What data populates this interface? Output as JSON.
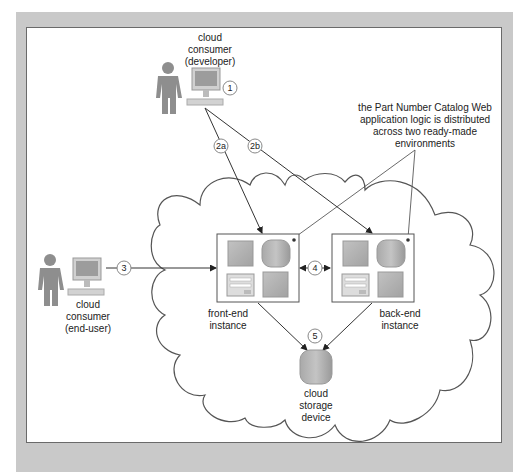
{
  "diagram": {
    "actors": {
      "developer": {
        "label_lines": [
          "cloud",
          "consumer",
          "(developer)"
        ]
      },
      "end_user": {
        "label_lines": [
          "cloud",
          "consumer",
          "(end-user)"
        ]
      }
    },
    "instances": {
      "front_end": {
        "label_lines": [
          "front-end",
          "instance"
        ]
      },
      "back_end": {
        "label_lines": [
          "back-end",
          "instance"
        ]
      }
    },
    "storage": {
      "label_lines": [
        "cloud",
        "storage",
        "device"
      ]
    },
    "annotation": {
      "lines": [
        "the Part Number Catalog Web",
        "application logic is distributed",
        "across two ready-made",
        "environments"
      ]
    },
    "steps": [
      "1",
      "2a",
      "2b",
      "3",
      "4",
      "5"
    ],
    "colors": {
      "frame": "#c9c9c9",
      "line": "#333333",
      "cloud_stroke": "#555555",
      "figure": "#8e8e8e",
      "icon_fill": "#b5b5b5"
    }
  }
}
